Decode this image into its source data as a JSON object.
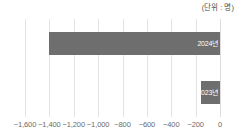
{
  "unit_caption": "(단위 : 명)",
  "chart_data": {
    "type": "bar",
    "orientation": "horizontal",
    "title": "",
    "subtitle": "",
    "xlabel": "",
    "ylabel": "",
    "unit_label": "(단위 : 명)",
    "categories": [
      "2024년",
      "2023년"
    ],
    "values": [
      -1400,
      -160
    ],
    "series": [
      {
        "name": "순이동",
        "values": [
          -1400,
          -160
        ]
      }
    ],
    "xlim": [
      -1600,
      0
    ],
    "xticks": [
      -1600,
      -1400,
      -1200,
      -1000,
      -800,
      -600,
      -400,
      -200,
      0
    ],
    "xticklabels": [
      "−1,600",
      "−1,400",
      "−1,200",
      "−1,000",
      "−800",
      "−600",
      "−400",
      "−200",
      "0"
    ],
    "grid": true,
    "grid_axis": "x",
    "legend": false,
    "legend_position": "none",
    "bar_color": "#6e6e6e",
    "grid_color": "#e3e3e3",
    "label_color": "#6b6b6b",
    "bar_label_color": "#ffffff",
    "data_labels_inside": true
  },
  "bars": [
    {
      "label": "2024년",
      "value": -1400
    },
    {
      "label": "2023년",
      "value": -160
    }
  ],
  "axis": {
    "ticks": [
      {
        "label": "−1,600",
        "value": -1600
      },
      {
        "label": "−1,400",
        "value": -1400
      },
      {
        "label": "−1,200",
        "value": -1200
      },
      {
        "label": "−1,000",
        "value": -1000
      },
      {
        "label": "−800",
        "value": -800
      },
      {
        "label": "−600",
        "value": -600
      },
      {
        "label": "−400",
        "value": -400
      },
      {
        "label": "−200",
        "value": -200
      },
      {
        "label": "0",
        "value": 0
      }
    ]
  }
}
